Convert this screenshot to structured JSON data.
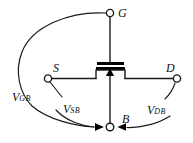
{
  "figure": {
    "type": "circuit-schematic",
    "device": "n-channel MOSFET",
    "stroke_color": "#1a1a1a",
    "background_color": "#ffffff"
  },
  "terminals": [
    {
      "id": "gate",
      "label": "G",
      "x": 110,
      "y": 12
    },
    {
      "id": "source",
      "label": "S",
      "x": 47,
      "y": 78
    },
    {
      "id": "drain",
      "label": "D",
      "x": 178,
      "y": 78
    },
    {
      "id": "bulk",
      "label": "B",
      "x": 112,
      "y": 127
    }
  ],
  "voltages": [
    {
      "id": "vgb",
      "symbol": "V",
      "subscript": "GB",
      "from": "gate",
      "to": "bulk"
    },
    {
      "id": "vsb",
      "symbol": "V",
      "subscript": "SB",
      "from": "source",
      "to": "bulk"
    },
    {
      "id": "vdb",
      "symbol": "V",
      "subscript": "DB",
      "from": "drain",
      "to": "bulk"
    }
  ]
}
